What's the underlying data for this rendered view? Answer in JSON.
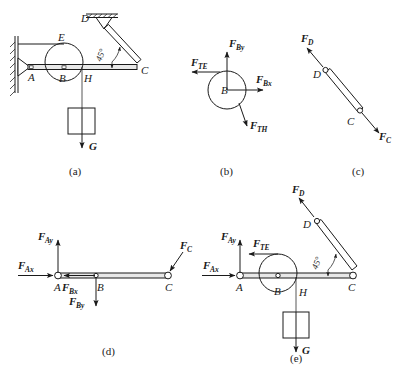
{
  "figure": {
    "type": "engineering-free-body-diagrams",
    "panels": [
      {
        "id": "a",
        "caption": "(a)",
        "description": "Assembly: horizontal bar AC pinned to wall at A, pulley B on bar, strut DC from ceiling at 45 degrees, weight G hanging at H",
        "point_labels": [
          "A",
          "B",
          "C",
          "D",
          "E",
          "H"
        ],
        "force_labels": [
          "G"
        ],
        "angle_label": "45°"
      },
      {
        "id": "b",
        "caption": "(b)",
        "description": "Free body diagram of pulley B",
        "point_labels": [
          "B"
        ],
        "forces": [
          {
            "name": "F",
            "sub": "TE",
            "dir": "left"
          },
          {
            "name": "F",
            "sub": "By",
            "dir": "up"
          },
          {
            "name": "F",
            "sub": "Bx",
            "dir": "right"
          },
          {
            "name": "F",
            "sub": "TH",
            "dir": "down"
          }
        ]
      },
      {
        "id": "c",
        "caption": "(c)",
        "description": "Free body diagram of two-force member DC",
        "point_labels": [
          "D",
          "C"
        ],
        "forces": [
          {
            "name": "F",
            "sub": "D",
            "dir": "up-left"
          },
          {
            "name": "F",
            "sub": "C",
            "dir": "down-right"
          }
        ]
      },
      {
        "id": "d",
        "caption": "(d)",
        "description": "Free body diagram of horizontal bar AC",
        "point_labels": [
          "A",
          "B",
          "C"
        ],
        "forces": [
          {
            "name": "F",
            "sub": "Ax",
            "dir": "right"
          },
          {
            "name": "F",
            "sub": "Ay",
            "dir": "up"
          },
          {
            "name": "F",
            "sub": "Bx",
            "dir": "left"
          },
          {
            "name": "F",
            "sub": "By",
            "dir": "down"
          },
          {
            "name": "F",
            "sub": "C",
            "dir": "down-left"
          }
        ]
      },
      {
        "id": "e",
        "caption": "(e)",
        "description": "Free body diagram of the whole assembly",
        "point_labels": [
          "A",
          "B",
          "C",
          "D",
          "H"
        ],
        "angle_label": "45°",
        "forces": [
          {
            "name": "F",
            "sub": "Ax",
            "dir": "right"
          },
          {
            "name": "F",
            "sub": "Ay",
            "dir": "up"
          },
          {
            "name": "F",
            "sub": "TE",
            "dir": "left"
          },
          {
            "name": "F",
            "sub": "D",
            "dir": "up-right"
          },
          {
            "name": "G",
            "sub": "",
            "dir": "down"
          }
        ]
      }
    ]
  },
  "colors": {
    "ink": "#1a1a1a",
    "bar": "#e8e8e8",
    "paper": "#ffffff"
  },
  "text": {
    "F": "F",
    "G": "G",
    "A": "A",
    "B": "B",
    "C": "C",
    "D": "D",
    "E": "E",
    "H": "H",
    "angle45": "45°",
    "sub_TE": "TE",
    "sub_TH": "TH",
    "sub_Bx": "Bx",
    "sub_By": "By",
    "sub_Ax": "Ax",
    "sub_Ay": "Ay",
    "sub_C": "C",
    "sub_D": "D",
    "cap_a": "(a)",
    "cap_b": "(b)",
    "cap_c": "(c)",
    "cap_d": "(d)",
    "cap_e": "(e)"
  }
}
